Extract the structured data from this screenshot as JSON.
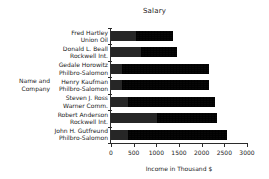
{
  "chart_data": {
    "type": "bar",
    "orientation": "horizontal",
    "stacked": true,
    "title": "Salary",
    "xlabel": "Income in Thousand $",
    "ylabel": "Name and\nCompany",
    "ylabel_lines": [
      "Name and",
      "Company"
    ],
    "xlim": [
      0,
      3000
    ],
    "xticks": [
      0,
      500,
      1000,
      1500,
      2000,
      2500,
      3000
    ],
    "xtick_labels": [
      "0",
      "500",
      "1000",
      "1500",
      "2000",
      "2500",
      "3000"
    ],
    "grid": false,
    "legend": "none",
    "categories": [
      "Fred Hartley\nUnion Oil",
      "Donald L. Beall\nRockwell Int.",
      "Gedale Horowitz\nPhilbro-Salomon",
      "Henry Kaufman\nPhilbro-Salomon",
      "Steven J. Ross\nWarner Comm.",
      "Robert Anderson\nRockwell Int.",
      "John H. Gutfreund\nPhilbro-Salomon"
    ],
    "category_lines": [
      [
        "Fred Hartley",
        "Union Oil"
      ],
      [
        "Donald L.  Beall",
        "Rockwell Int."
      ],
      [
        "Gedale Horowitz",
        "Philbro-Salomon"
      ],
      [
        "Henry Kaufman",
        "Philbro-Salomon"
      ],
      [
        "Steven J. Ross",
        "Warner Comm."
      ],
      [
        "Robert Anderson",
        "Rockwell Int."
      ],
      [
        "John H. Gutfreund",
        "Philbro-Salomon"
      ]
    ],
    "series": [
      {
        "name": "Salary",
        "style": "solid",
        "values": [
          550,
          660,
          250,
          250,
          380,
          1020,
          380
        ]
      },
      {
        "name": "Other income",
        "style": "hatched",
        "values": [
          820,
          800,
          1910,
          1910,
          1920,
          1320,
          2180
        ]
      }
    ],
    "totals": [
      1370,
      1460,
      2160,
      2160,
      2300,
      2340,
      2560
    ],
    "colors": {
      "solid": "#262626",
      "hatched": "#3a3a3a",
      "axis": "#2b2b2b",
      "text": "#1a1a1a",
      "background": "#ffffff"
    }
  }
}
